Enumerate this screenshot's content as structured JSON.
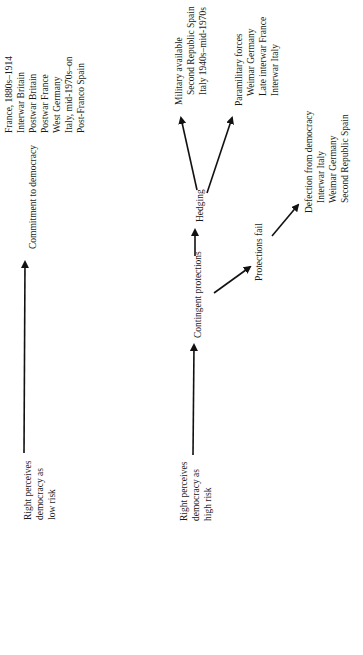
{
  "diagram": {
    "low_risk": {
      "start_label": [
        "Right perceives",
        "democracy as",
        "low risk"
      ],
      "outcome": "Commitment to democracy",
      "cases": [
        "France, 1880s–1914",
        "Interwar Britain",
        "Postwar Britain",
        "Postwar France",
        "West Germany",
        "Italy, mid-1970s–on",
        "Post-Franco Spain"
      ]
    },
    "high_risk": {
      "start_label": [
        "Right perceives",
        "democracy as",
        "high risk"
      ],
      "step1": "Contingent protections",
      "step2": "Hedging",
      "military": {
        "title": "Military available",
        "cases": [
          "Second Republic Spain",
          "Italy 1940s–mid-1970s"
        ]
      },
      "paramilitary": {
        "title": "Paramilitary forces",
        "cases": [
          "Weimar Germany",
          "Late interwar France",
          "Interwar Italy"
        ]
      },
      "fail": "Protections fail",
      "defection": {
        "title": "Defection from democracy",
        "cases": [
          "Interwar Italy",
          "Weimar Germany",
          "Second Republic Spain"
        ]
      }
    },
    "colors": {
      "ink": "#1a1a1a",
      "background": "#ffffff"
    }
  }
}
